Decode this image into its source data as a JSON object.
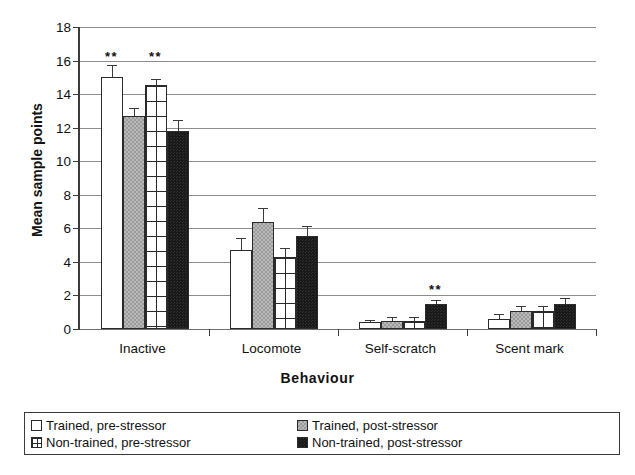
{
  "chart_data": {
    "type": "bar",
    "title": "",
    "xlabel": "Behaviour",
    "ylabel": "Mean sample points",
    "categories": [
      "Inactive",
      "Locomote",
      "Self-scratch",
      "Scent mark"
    ],
    "ylim": [
      0,
      18
    ],
    "yticks": [
      0,
      2,
      4,
      6,
      8,
      10,
      12,
      14,
      16,
      18
    ],
    "grid": true,
    "legend_position": "bottom",
    "series": [
      {
        "name": "Trained, pre-stressor",
        "fill": "white",
        "values": [
          15.0,
          4.7,
          0.4,
          0.6
        ],
        "errors": [
          0.75,
          0.7,
          0.15,
          0.3
        ]
      },
      {
        "name": "Trained, post-stressor",
        "fill": "gray",
        "values": [
          12.7,
          6.35,
          0.5,
          1.05
        ],
        "errors": [
          0.45,
          0.85,
          0.2,
          0.35
        ]
      },
      {
        "name": "Non-trained, pre-stressor",
        "fill": "grid",
        "values": [
          14.55,
          4.3,
          0.45,
          1.1
        ],
        "errors": [
          0.35,
          0.55,
          0.25,
          0.3
        ]
      },
      {
        "name": "Non-trained, post-stressor",
        "fill": "black",
        "values": [
          11.8,
          5.55,
          1.5,
          1.5
        ],
        "errors": [
          0.65,
          0.6,
          0.25,
          0.35
        ]
      }
    ],
    "annotations": [
      {
        "text": "**",
        "category": "Inactive",
        "series": "Trained, pre-stressor",
        "x_value": 0.5,
        "y_value": 16.6
      },
      {
        "text": "**",
        "category": "Inactive",
        "series": "Non-trained, pre-stressor",
        "x_value": 2.5,
        "y_value": 16.6
      },
      {
        "text": "**",
        "category": "Self-scratch",
        "series": "Non-trained, post-stressor",
        "x_value": 3.5,
        "y_value": 2.75
      }
    ]
  },
  "legend": {
    "items": [
      {
        "label": "Trained, pre-stressor",
        "fill": "white"
      },
      {
        "label": "Non-trained, pre-stressor",
        "fill": "grid"
      },
      {
        "label": "Trained, post-stressor",
        "fill": "gray"
      },
      {
        "label": "Non-trained, post-stressor",
        "fill": "black"
      }
    ]
  }
}
